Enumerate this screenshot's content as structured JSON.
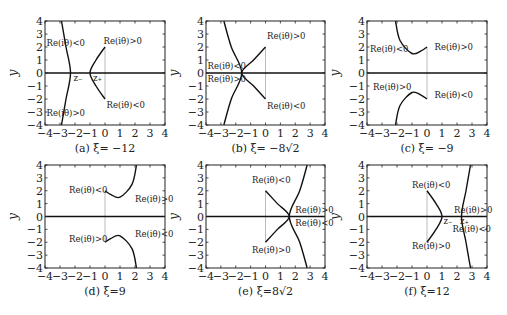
{
  "figure": {
    "axis": {
      "xlim": [
        -4,
        4
      ],
      "ylim": [
        -4,
        4
      ],
      "xticks": [
        -4,
        -3,
        -2,
        -1,
        0,
        1,
        2,
        3,
        4
      ],
      "yticks": [
        -4,
        -3,
        -2,
        -1,
        0,
        1,
        2,
        3,
        4
      ],
      "ylabel": "y"
    },
    "panels": [
      {
        "id": "a",
        "caption": "(a) ξ= −12",
        "frame": {
          "x0": 45,
          "x1": 165,
          "y0": 21,
          "y1": 125
        },
        "curves": [
          [
            [
              -2.9,
              4
            ],
            [
              -2.6,
              2
            ],
            [
              -2.3,
              0
            ],
            [
              -2.6,
              -2
            ],
            [
              -2.9,
              -4
            ]
          ],
          [
            [
              0,
              2
            ],
            [
              -0.6,
              1
            ],
            [
              -1.0,
              0
            ],
            [
              -0.6,
              -1
            ],
            [
              0,
              -2
            ]
          ]
        ],
        "cut": [
          [
            0,
            2
          ],
          [
            0,
            -2
          ]
        ],
        "labels": [
          {
            "text": "Re(iθ)<0",
            "x": -3.9,
            "y": 2.1
          },
          {
            "text": "Re(iθ)>0",
            "x": -0.1,
            "y": 2.2
          },
          {
            "text": "Re(iθ)<0",
            "x": 0.1,
            "y": -2.7
          },
          {
            "text": "Re(iθ)>0",
            "x": -3.9,
            "y": -3.3
          },
          {
            "text": "z₋",
            "x": -2.1,
            "y": -0.6
          },
          {
            "text": "z₊",
            "x": -0.8,
            "y": -0.6
          }
        ]
      },
      {
        "id": "b",
        "caption": "(b) ξ= −8√2",
        "frame": {
          "x0": 206,
          "x1": 325,
          "y0": 21,
          "y1": 125
        },
        "curves": [
          [
            [
              -2.8,
              4
            ],
            [
              -2.3,
              2
            ],
            [
              -1.6,
              0
            ],
            [
              -2.3,
              -2
            ],
            [
              -2.8,
              -4
            ]
          ],
          [
            [
              0,
              2
            ],
            [
              -0.8,
              1
            ],
            [
              -1.6,
              0
            ],
            [
              -0.8,
              -1
            ],
            [
              0,
              -2
            ]
          ]
        ],
        "cut": [
          [
            0,
            2
          ],
          [
            0,
            -2
          ]
        ],
        "labels": [
          {
            "text": "Re(iθ)>0",
            "x": 0.1,
            "y": 2.6
          },
          {
            "text": "Re(iθ)<0",
            "x": -3.9,
            "y": 0.3
          },
          {
            "text": "Re(iθ)>0",
            "x": -3.9,
            "y": -0.7
          },
          {
            "text": "Re(iθ)<0",
            "x": 0.1,
            "y": -2.8
          }
        ]
      },
      {
        "id": "c",
        "caption": "(c) ξ= −9",
        "frame": {
          "x0": 367,
          "x1": 487,
          "y0": 21,
          "y1": 125
        },
        "curves": [
          [
            [
              -2.1,
              4
            ],
            [
              -1.8,
              2.5
            ],
            [
              -1.0,
              1.5
            ],
            [
              -0.4,
              1.7
            ],
            [
              0,
              2
            ]
          ],
          [
            [
              -2.1,
              -4
            ],
            [
              -1.8,
              -2.5
            ],
            [
              -1.0,
              -1.5
            ],
            [
              -0.4,
              -1.7
            ],
            [
              0,
              -2
            ]
          ]
        ],
        "cut": [
          [
            0,
            2
          ],
          [
            0,
            -2
          ]
        ],
        "labels": [
          {
            "text": "Re(iθ)<0",
            "x": -3.8,
            "y": 1.6
          },
          {
            "text": "Re(iθ)>0",
            "x": 0.5,
            "y": 1.8
          },
          {
            "text": "Re(iθ)>0",
            "x": -3.6,
            "y": -1.3
          },
          {
            "text": "Re(iθ)<0",
            "x": 0.5,
            "y": -1.9
          }
        ]
      },
      {
        "id": "d",
        "caption": "(d) ξ=9",
        "frame": {
          "x0": 45,
          "x1": 165,
          "y0": 165,
          "y1": 268
        },
        "curves": [
          [
            [
              2.1,
              4
            ],
            [
              1.8,
              2.5
            ],
            [
              1.0,
              1.5
            ],
            [
              0.4,
              1.7
            ],
            [
              0,
              2
            ]
          ],
          [
            [
              2.1,
              -4
            ],
            [
              1.8,
              -2.5
            ],
            [
              1.0,
              -1.5
            ],
            [
              0.4,
              -1.7
            ],
            [
              0,
              -2
            ]
          ]
        ],
        "cut": [
          [
            0,
            2
          ],
          [
            0,
            -2
          ]
        ],
        "labels": [
          {
            "text": "Re(iθ)<0",
            "x": -2.4,
            "y": 1.8
          },
          {
            "text": "Re(iθ)>0",
            "x": 2.0,
            "y": 1.1
          },
          {
            "text": "Re(iθ)>0",
            "x": -2.4,
            "y": -2.0
          },
          {
            "text": "Re(iθ)<0",
            "x": 2.0,
            "y": -1.6
          }
        ]
      },
      {
        "id": "e",
        "caption": "(e) ξ=8√2",
        "frame": {
          "x0": 206,
          "x1": 325,
          "y0": 165,
          "y1": 268
        },
        "curves": [
          [
            [
              2.8,
              4
            ],
            [
              2.3,
              2
            ],
            [
              1.6,
              0
            ],
            [
              2.3,
              -2
            ],
            [
              2.8,
              -4
            ]
          ],
          [
            [
              0,
              2
            ],
            [
              0.8,
              1
            ],
            [
              1.6,
              0
            ],
            [
              0.8,
              -1
            ],
            [
              0,
              -2
            ]
          ]
        ],
        "cut": [
          [
            0,
            2
          ],
          [
            0,
            -2
          ]
        ],
        "labels": [
          {
            "text": "Re(iθ)<0",
            "x": -0.9,
            "y": 2.6
          },
          {
            "text": "Re(iθ)>0",
            "x": 2.0,
            "y": 0.3
          },
          {
            "text": "Re(iθ)<0",
            "x": 2.0,
            "y": -0.7
          },
          {
            "text": "Re(iθ)>0",
            "x": -0.9,
            "y": -2.8
          }
        ]
      },
      {
        "id": "f",
        "caption": "(f) ξ=12",
        "frame": {
          "x0": 367,
          "x1": 487,
          "y0": 165,
          "y1": 268
        },
        "curves": [
          [
            [
              2.9,
              4
            ],
            [
              2.6,
              2
            ],
            [
              2.3,
              0
            ],
            [
              2.6,
              -2
            ],
            [
              2.9,
              -4
            ]
          ],
          [
            [
              0,
              2
            ],
            [
              0.6,
              1
            ],
            [
              1.0,
              0
            ],
            [
              0.6,
              -1
            ],
            [
              0,
              -2
            ]
          ]
        ],
        "cut": [
          [
            0,
            2
          ],
          [
            0,
            -2
          ]
        ],
        "labels": [
          {
            "text": "Re(iθ)<0",
            "x": -1.0,
            "y": 2.2
          },
          {
            "text": "Re(iθ)>0",
            "x": 1.8,
            "y": 0.3
          },
          {
            "text": "Re(iθ)<0",
            "x": 1.7,
            "y": -1.2
          },
          {
            "text": "Re(iθ)>0",
            "x": -1.0,
            "y": -2.5
          },
          {
            "text": "z₋",
            "x": 1.1,
            "y": -0.6
          },
          {
            "text": "z₊",
            "x": 2.2,
            "y": -0.6
          }
        ]
      }
    ]
  },
  "chart_data": [
    {
      "type": "line",
      "title": "(a) ξ= −12",
      "xlabel": "",
      "ylabel": "y",
      "xlim": [
        -4,
        4
      ],
      "ylim": [
        -4,
        4
      ],
      "series": [
        {
          "name": "left branch",
          "points": [
            [
              -2.9,
              4
            ],
            [
              -2.6,
              2
            ],
            [
              -2.3,
              0
            ],
            [
              -2.6,
              -2
            ],
            [
              -2.9,
              -4
            ]
          ]
        },
        {
          "name": "right arc",
          "points": [
            [
              0,
              2
            ],
            [
              -0.6,
              1
            ],
            [
              -1.0,
              0
            ],
            [
              -0.6,
              -1
            ],
            [
              0,
              -2
            ]
          ]
        }
      ],
      "annotations": [
        "Re(iθ)<0",
        "Re(iθ)>0",
        "Re(iθ)<0",
        "Re(iθ)>0",
        "z₋",
        "z₊"
      ]
    },
    {
      "type": "line",
      "title": "(b) ξ= −8√2",
      "xlabel": "",
      "ylabel": "y",
      "xlim": [
        -4,
        4
      ],
      "ylim": [
        -4,
        4
      ],
      "series": [
        {
          "name": "outer branch",
          "points": [
            [
              -2.8,
              4
            ],
            [
              -2.3,
              2
            ],
            [
              -1.6,
              0
            ],
            [
              -2.3,
              -2
            ],
            [
              -2.8,
              -4
            ]
          ]
        },
        {
          "name": "inner arc",
          "points": [
            [
              0,
              2
            ],
            [
              -0.8,
              1
            ],
            [
              -1.6,
              0
            ],
            [
              -0.8,
              -1
            ],
            [
              0,
              -2
            ]
          ]
        }
      ],
      "annotations": [
        "Re(iθ)>0",
        "Re(iθ)<0",
        "Re(iθ)>0",
        "Re(iθ)<0"
      ]
    },
    {
      "type": "line",
      "title": "(c) ξ= −9",
      "xlabel": "",
      "ylabel": "y",
      "xlim": [
        -4,
        4
      ],
      "ylim": [
        -4,
        4
      ],
      "series": [
        {
          "name": "upper",
          "points": [
            [
              -2.1,
              4
            ],
            [
              -1.8,
              2.5
            ],
            [
              -1.0,
              1.5
            ],
            [
              -0.4,
              1.7
            ],
            [
              0,
              2
            ]
          ]
        },
        {
          "name": "lower",
          "points": [
            [
              -2.1,
              -4
            ],
            [
              -1.8,
              -2.5
            ],
            [
              -1.0,
              -1.5
            ],
            [
              -0.4,
              -1.7
            ],
            [
              0,
              -2
            ]
          ]
        }
      ],
      "annotations": [
        "Re(iθ)<0",
        "Re(iθ)>0",
        "Re(iθ)>0",
        "Re(iθ)<0"
      ]
    },
    {
      "type": "line",
      "title": "(d) ξ=9",
      "xlabel": "",
      "ylabel": "y",
      "xlim": [
        -4,
        4
      ],
      "ylim": [
        -4,
        4
      ],
      "series": [
        {
          "name": "upper",
          "points": [
            [
              2.1,
              4
            ],
            [
              1.8,
              2.5
            ],
            [
              1.0,
              1.5
            ],
            [
              0.4,
              1.7
            ],
            [
              0,
              2
            ]
          ]
        },
        {
          "name": "lower",
          "points": [
            [
              2.1,
              -4
            ],
            [
              1.8,
              -2.5
            ],
            [
              1.0,
              -1.5
            ],
            [
              0.4,
              -1.7
            ],
            [
              0,
              -2
            ]
          ]
        }
      ],
      "annotations": [
        "Re(iθ)<0",
        "Re(iθ)>0",
        "Re(iθ)>0",
        "Re(iθ)<0"
      ]
    },
    {
      "type": "line",
      "title": "(e) ξ=8√2",
      "xlabel": "",
      "ylabel": "y",
      "xlim": [
        -4,
        4
      ],
      "ylim": [
        -4,
        4
      ],
      "series": [
        {
          "name": "outer branch",
          "points": [
            [
              2.8,
              4
            ],
            [
              2.3,
              2
            ],
            [
              1.6,
              0
            ],
            [
              2.3,
              -2
            ],
            [
              2.8,
              -4
            ]
          ]
        },
        {
          "name": "inner arc",
          "points": [
            [
              0,
              2
            ],
            [
              0.8,
              1
            ],
            [
              1.6,
              0
            ],
            [
              0.8,
              -1
            ],
            [
              0,
              -2
            ]
          ]
        }
      ],
      "annotations": [
        "Re(iθ)<0",
        "Re(iθ)>0",
        "Re(iθ)<0",
        "Re(iθ)>0"
      ]
    },
    {
      "type": "line",
      "title": "(f) ξ=12",
      "xlabel": "",
      "ylabel": "y",
      "xlim": [
        -4,
        4
      ],
      "ylim": [
        -4,
        4
      ],
      "series": [
        {
          "name": "right branch",
          "points": [
            [
              2.9,
              4
            ],
            [
              2.6,
              2
            ],
            [
              2.3,
              0
            ],
            [
              2.6,
              -2
            ],
            [
              2.9,
              -4
            ]
          ]
        },
        {
          "name": "left arc",
          "points": [
            [
              0,
              2
            ],
            [
              0.6,
              1
            ],
            [
              1.0,
              0
            ],
            [
              0.6,
              -1
            ],
            [
              0,
              -2
            ]
          ]
        }
      ],
      "annotations": [
        "Re(iθ)<0",
        "Re(iθ)>0",
        "Re(iθ)<0",
        "Re(iθ)>0",
        "z₋",
        "z₊"
      ]
    }
  ]
}
